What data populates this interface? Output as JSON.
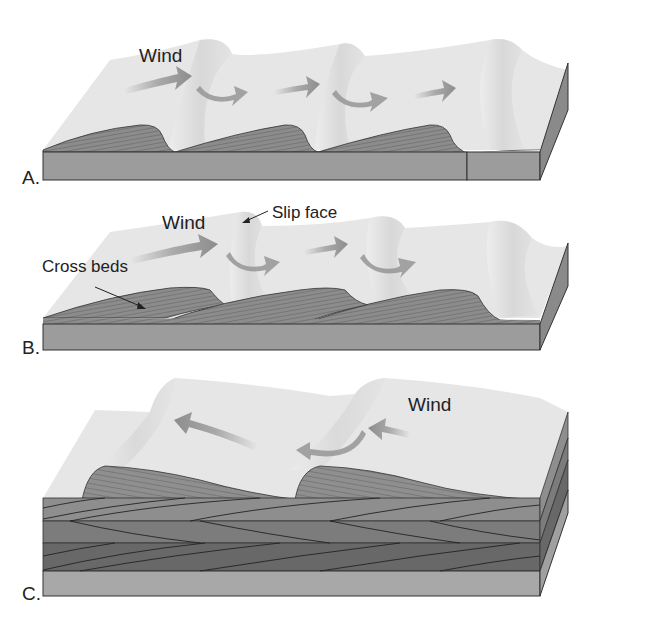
{
  "figure": {
    "type": "block diagram"
  },
  "panels": [
    {
      "id": "A",
      "letter": "A.",
      "labels": {
        "wind": "Wind"
      },
      "wind_direction": "left-to-right",
      "dunes": 3
    },
    {
      "id": "B",
      "letter": "B.",
      "labels": {
        "wind": "Wind",
        "slip_face": "Slip face",
        "cross_beds": "Cross beds"
      },
      "wind_direction": "left-to-right",
      "dunes": 3
    },
    {
      "id": "C",
      "letter": "C.",
      "labels": {
        "wind": "Wind"
      },
      "wind_direction": "right-to-left",
      "dunes": 2,
      "stratified_layers": 3
    }
  ],
  "colors": {
    "sand_surface": "#e6e6e6",
    "slip_face_shade": "#d4d4d4",
    "block_side": "#9a9a9a",
    "block_end": "#8a8a8a",
    "cross_bed_fill": "#8c8c8c",
    "arrow": "#8f8f8f",
    "layer_1": "#8e8e8e",
    "layer_2": "#7c7c7c",
    "layer_3": "#686868",
    "base_layer": "#a8a8a8",
    "outline": "#333333"
  }
}
